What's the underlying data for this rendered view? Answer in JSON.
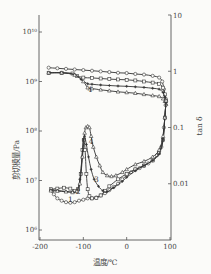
{
  "chart_data": {
    "type": "line",
    "title": "",
    "xlabel": "温度/℃",
    "ylabel": "剪切模量/Pa",
    "y2label": "tan δ",
    "xlim": [
      -200,
      100
    ],
    "ylim": [
      1000000.0,
      10000000000.0
    ],
    "y2lim": [
      0.001,
      10
    ],
    "yscale": "log",
    "y2scale": "log",
    "x_ticks": [
      -200,
      -100,
      0,
      100
    ],
    "x_tick_labels": [
      "-200",
      "-100",
      "0",
      "100"
    ],
    "y_ticks": [
      1000000.0,
      10000000.0,
      100000000.0,
      1000000000.0,
      10000000000.0
    ],
    "y_tick_labels": [
      "10⁶",
      "10⁷",
      "10⁸",
      "10⁹",
      "10¹⁰"
    ],
    "y2_ticks": [
      0.01,
      0.1,
      1,
      10
    ],
    "y2_tick_labels": [
      "0.01",
      "0.1",
      "1",
      "10"
    ],
    "grid": false,
    "legend": "none",
    "annotations": [
      {
        "text": "1",
        "x": -130,
        "y": 3600000.0
      },
      {
        "text": "2",
        "x": -112,
        "y": 5400000.0
      },
      {
        "text": "3",
        "x": -70,
        "y": 9200000.0
      },
      {
        "text": "4",
        "x": -85,
        "y": 600000000.0
      },
      {
        "text": "4",
        "x": -82,
        "y": 55000000.0
      }
    ],
    "series": [
      {
        "name": "1 modulus",
        "axis": "left",
        "marker": "circle",
        "x": [
          -180,
          -160,
          -140,
          -120,
          -100,
          -80,
          -60,
          -40,
          -20,
          0,
          20,
          40,
          60,
          75,
          82,
          86,
          90
        ],
        "y": [
          1900000000.0,
          1850000000.0,
          1800000000.0,
          1750000000.0,
          1700000000.0,
          1650000000.0,
          1600000000.0,
          1550000000.0,
          1500000000.0,
          1480000000.0,
          1420000000.0,
          1380000000.0,
          1300000000.0,
          1200000000.0,
          1000000000.0,
          700000000.0,
          450000000.0
        ]
      },
      {
        "name": "2 modulus",
        "axis": "left",
        "marker": "square",
        "x": [
          -180,
          -150,
          -125,
          -115,
          -100,
          -80,
          -60,
          -40,
          -20,
          0,
          20,
          40,
          60,
          75,
          84,
          88,
          91
        ],
        "y": [
          1500000000.0,
          1500000000.0,
          1450000000.0,
          1300000000.0,
          1200000000.0,
          1180000000.0,
          1150000000.0,
          1120000000.0,
          1100000000.0,
          1080000000.0,
          1050000000.0,
          1000000000.0,
          950000000.0,
          900000000.0,
          750000000.0,
          550000000.0,
          400000000.0
        ]
      },
      {
        "name": "3 modulus",
        "axis": "left",
        "marker": "cross",
        "x": [
          -180,
          -150,
          -120,
          -105,
          -90,
          -80,
          -60,
          -40,
          -20,
          0,
          20,
          40,
          60,
          75,
          84,
          88,
          91
        ],
        "y": [
          1500000000.0,
          1500000000.0,
          1400000000.0,
          1100000000.0,
          900000000.0,
          880000000.0,
          850000000.0,
          830000000.0,
          810000000.0,
          800000000.0,
          780000000.0,
          760000000.0,
          730000000.0,
          700000000.0,
          600000000.0,
          480000000.0,
          380000000.0
        ]
      },
      {
        "name": "4 modulus",
        "axis": "left",
        "marker": "triangle",
        "x": [
          -180,
          -150,
          -120,
          -100,
          -90,
          -80,
          -60,
          -40,
          -20,
          0,
          20,
          40,
          60,
          75,
          84,
          88,
          91
        ],
        "y": [
          1500000000.0,
          1500000000.0,
          1350000000.0,
          1000000000.0,
          750000000.0,
          720000000.0,
          680000000.0,
          650000000.0,
          620000000.0,
          600000000.0,
          580000000.0,
          550000000.0,
          520000000.0,
          500000000.0,
          450000000.0,
          400000000.0,
          350000000.0
        ]
      },
      {
        "name": "1 tan δ",
        "axis": "right",
        "marker": "circle",
        "x": [
          -172,
          -168,
          -160,
          -150,
          -140,
          -130,
          -120,
          -110,
          -100,
          -90,
          -80,
          -70,
          -60,
          -50,
          -40,
          -30,
          -20,
          -10,
          0,
          10,
          20,
          30,
          40,
          50,
          60,
          70,
          80,
          86,
          90
        ],
        "y": [
          0.0075,
          0.0065,
          0.0055,
          0.005,
          0.0047,
          0.0046,
          0.0047,
          0.005,
          0.0052,
          0.0055,
          0.0055,
          0.0057,
          0.0062,
          0.0068,
          0.0077,
          0.0088,
          0.01,
          0.012,
          0.014,
          0.016,
          0.018,
          0.019,
          0.021,
          0.023,
          0.026,
          0.032,
          0.045,
          0.1,
          0.25
        ]
      },
      {
        "name": "2 tan δ",
        "axis": "right",
        "marker": "square",
        "x": [
          -175,
          -160,
          -145,
          -130,
          -120,
          -112,
          -106,
          -102,
          -99,
          -96,
          -93,
          -90,
          -86,
          -80,
          -70,
          -60,
          -50,
          -40,
          -20,
          0,
          20,
          40,
          60,
          75,
          84,
          88,
          91
        ],
        "y": [
          0.008,
          0.0082,
          0.0085,
          0.0082,
          0.0075,
          0.008,
          0.015,
          0.04,
          0.06,
          0.04,
          0.015,
          0.008,
          0.006,
          0.0055,
          0.0056,
          0.0062,
          0.0075,
          0.009,
          0.012,
          0.015,
          0.018,
          0.021,
          0.026,
          0.035,
          0.06,
          0.15,
          0.3
        ]
      },
      {
        "name": "3 tan δ",
        "axis": "right",
        "marker": "cross",
        "x": [
          -175,
          -160,
          -140,
          -125,
          -115,
          -108,
          -103,
          -100,
          -97,
          -93,
          -88,
          -82,
          -75,
          -65,
          -55,
          -45,
          -30,
          -10,
          0,
          20,
          40,
          60,
          75,
          84,
          88,
          91
        ],
        "y": [
          0.0078,
          0.0076,
          0.0073,
          0.0072,
          0.0075,
          0.012,
          0.03,
          0.06,
          0.07,
          0.05,
          0.03,
          0.018,
          0.012,
          0.009,
          0.0075,
          0.0072,
          0.0085,
          0.011,
          0.013,
          0.017,
          0.021,
          0.026,
          0.034,
          0.06,
          0.15,
          0.3
        ]
      },
      {
        "name": "4 tan δ",
        "axis": "right",
        "marker": "triangle",
        "x": [
          -175,
          -160,
          -140,
          -125,
          -115,
          -108,
          -102,
          -97,
          -94,
          -90,
          -86,
          -82,
          -77,
          -70,
          -62,
          -55,
          -45,
          -35,
          -25,
          -10,
          0,
          20,
          40,
          60,
          75,
          84,
          88,
          91
        ],
        "y": [
          0.0075,
          0.0074,
          0.0072,
          0.007,
          0.0073,
          0.01,
          0.03,
          0.08,
          0.1,
          0.105,
          0.1,
          0.07,
          0.045,
          0.03,
          0.021,
          0.016,
          0.014,
          0.0135,
          0.014,
          0.016,
          0.018,
          0.022,
          0.025,
          0.03,
          0.04,
          0.07,
          0.15,
          0.3
        ]
      }
    ]
  }
}
